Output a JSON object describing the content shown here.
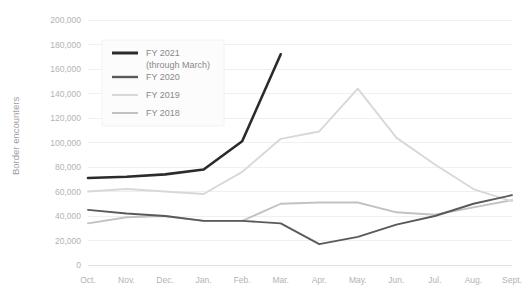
{
  "chart_data": {
    "type": "line",
    "title": "",
    "subtitle": "",
    "xlabel": "",
    "ylabel": "Border encounters",
    "ylim": [
      0,
      200000
    ],
    "ytick_values": [
      0,
      20000,
      40000,
      60000,
      80000,
      100000,
      120000,
      140000,
      160000,
      180000,
      200000
    ],
    "ytick_labels": [
      "0",
      "20,000",
      "40,000",
      "60,000",
      "80,000",
      "100,000",
      "120,000",
      "140,000",
      "160,000",
      "180,000",
      "200,000"
    ],
    "categories": [
      "Oct.",
      "Nov.",
      "Dec.",
      "Jan.",
      "Feb.",
      "Mar.",
      "Apr.",
      "May.",
      "Jun.",
      "Jul.",
      "Aug.",
      "Sept."
    ],
    "grid": "horizontal",
    "legend_position": "top-left-inside",
    "series": [
      {
        "name": "FY 2021",
        "note": "(through March)",
        "color": "#2b2b2b",
        "width": 2.6,
        "values": [
          71000,
          72000,
          74000,
          78000,
          101000,
          172000,
          null,
          null,
          null,
          null,
          null,
          null
        ]
      },
      {
        "name": "FY 2020",
        "note": "",
        "color": "#5a5a5a",
        "width": 1.9,
        "values": [
          45000,
          42000,
          40000,
          36000,
          36000,
          34000,
          17000,
          23000,
          33000,
          40000,
          50000,
          57000
        ]
      },
      {
        "name": "FY 2019",
        "note": "",
        "color": "#d8d8d8",
        "width": 1.9,
        "values": [
          60000,
          62000,
          60000,
          58000,
          76000,
          103000,
          109000,
          144000,
          104000,
          82000,
          62000,
          52000
        ]
      },
      {
        "name": "FY 2018",
        "note": "",
        "color": "#c2c2c2",
        "width": 1.9,
        "values": [
          34000,
          39000,
          40000,
          36000,
          36000,
          50000,
          51000,
          51000,
          43000,
          41000,
          47000,
          53000
        ]
      }
    ]
  },
  "legend": {
    "entries": [
      {
        "label": "FY 2021",
        "sublabel": "(through March)"
      },
      {
        "label": "FY 2020",
        "sublabel": ""
      },
      {
        "label": "FY 2019",
        "sublabel": ""
      },
      {
        "label": "FY 2018",
        "sublabel": ""
      }
    ]
  }
}
